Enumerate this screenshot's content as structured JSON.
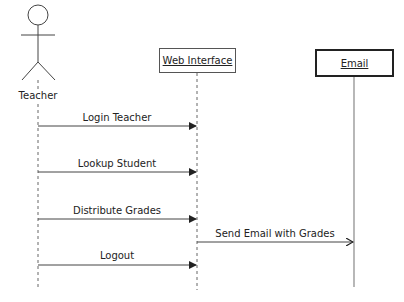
{
  "diagram": {
    "type": "sequence",
    "actors": [
      {
        "name": "Teacher",
        "kind": "stick-figure"
      },
      {
        "name": "Web Interface",
        "kind": "object"
      },
      {
        "name": "Email",
        "kind": "object",
        "style": "bold-border",
        "lifeline": "solid"
      }
    ],
    "messages": [
      {
        "label": "Login Teacher",
        "from": "Teacher",
        "to": "Web Interface"
      },
      {
        "label": "Lookup Student",
        "from": "Teacher",
        "to": "Web Interface"
      },
      {
        "label": "Distribute Grades",
        "from": "Teacher",
        "to": "Web Interface"
      },
      {
        "label": "Send Email with Grades",
        "from": "Web Interface",
        "to": "Email",
        "arrow": "open"
      },
      {
        "label": "Logout",
        "from": "Teacher",
        "to": "Web Interface"
      }
    ]
  }
}
